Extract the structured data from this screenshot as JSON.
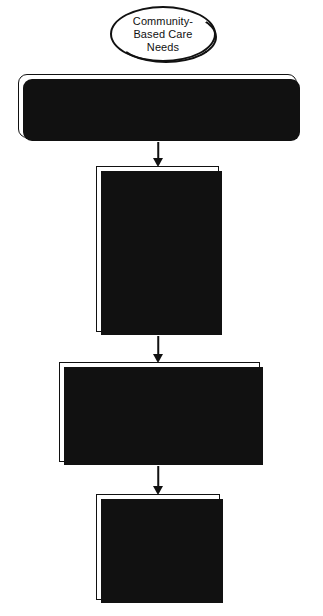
{
  "diagram": {
    "colors": {
      "stroke": "#111111",
      "fill": "#ffffff",
      "shadow": "#111111",
      "background": "#ffffff"
    },
    "nodes": {
      "oval": {
        "shape": "ellipse",
        "lines": [
          "Community-",
          "Based Care",
          "Needs"
        ]
      },
      "header": {
        "shape": "rounded-rectangle",
        "lines": [
          "Andrea Wang",
          "Spinal Cord Injury",
          "Rehabilitation and Continuity of Care"
        ]
      },
      "health_teaching": {
        "shape": "rectangle",
        "lines": [
          "Health Teaching"
        ]
      },
      "home_care_management": {
        "shape": "rectangle",
        "lines": [
          "Home Care Management"
        ]
      },
      "health_care_resources": {
        "shape": "rectangle",
        "lines": [
          "Health Care",
          "Resources"
        ]
      }
    },
    "connectors": [
      {
        "from": "header",
        "to": "health_teaching",
        "style": "arrow-down"
      },
      {
        "from": "health_teaching",
        "to": "home_care_management",
        "style": "arrow-down"
      },
      {
        "from": "home_care_management",
        "to": "health_care_resources",
        "style": "arrow-down"
      }
    ]
  }
}
